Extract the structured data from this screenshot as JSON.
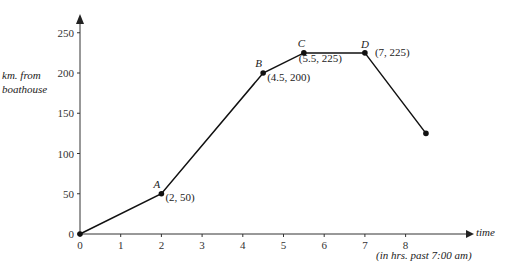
{
  "chart_data": {
    "type": "line",
    "title": "",
    "xlabel": "time",
    "xlabel_note": "(in hrs. past 7:00 am)",
    "ylabel": "km. from boathouse",
    "xlim": [
      0,
      9
    ],
    "ylim": [
      0,
      260
    ],
    "x_ticks": [
      0,
      1,
      2,
      3,
      4,
      5,
      6,
      7,
      8
    ],
    "y_ticks": [
      0,
      50,
      100,
      150,
      200,
      250
    ],
    "grid": false,
    "series": [
      {
        "name": "distance",
        "x": [
          0,
          2,
          4.5,
          5.5,
          7,
          8.5
        ],
        "y": [
          0,
          50,
          200,
          225,
          225,
          125
        ]
      }
    ],
    "annotations": [
      {
        "label": "A",
        "coord": "(2, 50)",
        "x": 2,
        "y": 50
      },
      {
        "label": "B",
        "coord": "(4.5, 200)",
        "x": 4.5,
        "y": 200
      },
      {
        "label": "C",
        "coord": "(5.5, 225)",
        "x": 5.5,
        "y": 225
      },
      {
        "label": "D",
        "coord": "(7, 225)",
        "x": 7,
        "y": 225
      }
    ]
  },
  "labels": {
    "ylabel_line1": "km. from",
    "ylabel_line2": "boathouse",
    "xlabel": "time",
    "xnote": "(in hrs. past 7:00 am)"
  }
}
